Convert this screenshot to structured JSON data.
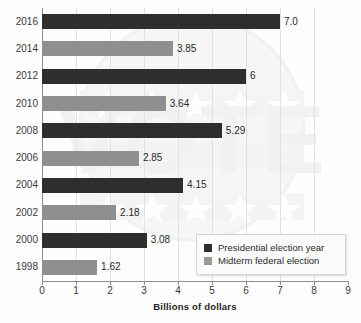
{
  "chart_data": {
    "type": "bar",
    "orientation": "horizontal",
    "title": "",
    "xlabel": "Billions of dollars",
    "ylabel": "",
    "xlim": [
      0,
      9
    ],
    "xticks": [
      0,
      1,
      2,
      3,
      4,
      5,
      6,
      7,
      8,
      9
    ],
    "grid": true,
    "legend_position": "bottom-right",
    "categories": [
      "2016",
      "2014",
      "2012",
      "2010",
      "2008",
      "2006",
      "2004",
      "2002",
      "2000",
      "1998"
    ],
    "values": [
      7.0,
      3.85,
      6,
      3.64,
      5.29,
      2.85,
      4.15,
      2.18,
      3.08,
      1.62
    ],
    "value_labels": [
      "7.0",
      "3.85",
      "6",
      "3.64",
      "5.29",
      "2.85",
      "4.15",
      "2.18",
      "3.08",
      "1.62"
    ],
    "series": [
      {
        "name": "Presidential election year",
        "color": "#2e2e2e",
        "points": [
          {
            "category": "2016",
            "value": 7.0,
            "label": "7.0"
          },
          {
            "category": "2012",
            "value": 6,
            "label": "6"
          },
          {
            "category": "2008",
            "value": 5.29,
            "label": "5.29"
          },
          {
            "category": "2004",
            "value": 4.15,
            "label": "4.15"
          },
          {
            "category": "2000",
            "value": 3.08,
            "label": "3.08"
          }
        ]
      },
      {
        "name": "Midterm federal election",
        "color": "#8f8f8f",
        "points": [
          {
            "category": "2014",
            "value": 3.85,
            "label": "3.85"
          },
          {
            "category": "2010",
            "value": 3.64,
            "label": "3.64"
          },
          {
            "category": "2006",
            "value": 2.85,
            "label": "2.85"
          },
          {
            "category": "2002",
            "value": 2.18,
            "label": "2.18"
          },
          {
            "category": "1998",
            "value": 1.62,
            "label": "1.62"
          }
        ]
      }
    ],
    "bars": [
      {
        "category": "2016",
        "value": 7.0,
        "label": "7.0",
        "series": "Presidential election year"
      },
      {
        "category": "2014",
        "value": 3.85,
        "label": "3.85",
        "series": "Midterm federal election"
      },
      {
        "category": "2012",
        "value": 6,
        "label": "6",
        "series": "Presidential election year"
      },
      {
        "category": "2010",
        "value": 3.64,
        "label": "3.64",
        "series": "Midterm federal election"
      },
      {
        "category": "2008",
        "value": 5.29,
        "label": "5.29",
        "series": "Presidential election year"
      },
      {
        "category": "2006",
        "value": 2.85,
        "label": "2.85",
        "series": "Midterm federal election"
      },
      {
        "category": "2004",
        "value": 4.15,
        "label": "4.15",
        "series": "Presidential election year"
      },
      {
        "category": "2002",
        "value": 2.18,
        "label": "2.18",
        "series": "Midterm federal election"
      },
      {
        "category": "2000",
        "value": 3.08,
        "label": "3.08",
        "series": "Presidential election year"
      },
      {
        "category": "1998",
        "value": 1.62,
        "label": "1.62",
        "series": "Midterm federal election"
      }
    ]
  },
  "legend": {
    "items": [
      {
        "label": "Presidential election year",
        "color": "#2e2e2e"
      },
      {
        "label": "Midterm federal election",
        "color": "#9a9a9a"
      }
    ]
  },
  "watermark": {
    "text": "VOTE",
    "color": "#ececec"
  },
  "colors": {
    "presidential": "#2e2e2e",
    "midterm": "#8f8f8f",
    "grid": "#e2e2e2",
    "axis": "#8d8d8d",
    "text": "#2a2a2a",
    "background": "#fdfdfd"
  }
}
